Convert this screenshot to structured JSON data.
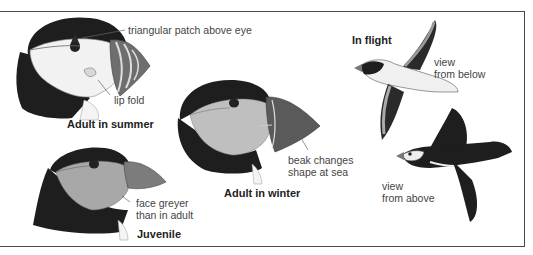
{
  "header": {
    "cutoff_text": "g ... y ... p ... g ... g"
  },
  "figures": {
    "adult_summer": {
      "caption": "Adult in summer",
      "labels": {
        "patch": "triangular patch above eye",
        "lip": "lip fold"
      }
    },
    "adult_winter": {
      "caption": "Adult in winter",
      "labels": {
        "beak_line1": "beak changes",
        "beak_line2": "shape at sea"
      }
    },
    "juvenile": {
      "caption": "Juvenile",
      "labels": {
        "face_line1": "face greyer",
        "face_line2": "than in adult"
      }
    },
    "in_flight": {
      "caption": "In flight",
      "below": {
        "line1": "view",
        "line2": "from below"
      },
      "above": {
        "line1": "view",
        "line2": "from above"
      }
    }
  },
  "colors": {
    "border": "#4a4a4a",
    "dark_plumage": "#1e1e1e",
    "face": "#e8e8e8",
    "face_grey": "#b5b5b5",
    "beak": "#7a7a7a",
    "label_text": "#444444"
  }
}
